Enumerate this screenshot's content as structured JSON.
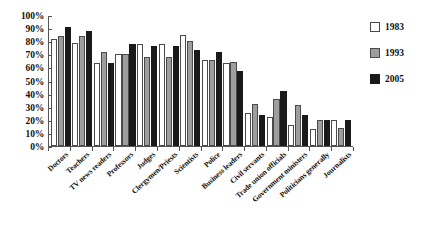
{
  "chart_data": {
    "type": "bar",
    "title": "",
    "xlabel": "",
    "ylabel": "",
    "ylim": [
      0,
      100
    ],
    "ytick_labels": [
      "100%",
      "90%",
      "80%",
      "70%",
      "60%",
      "50%",
      "40%",
      "30%",
      "20%",
      "10%",
      "0%"
    ],
    "ytick_values": [
      100,
      90,
      80,
      70,
      60,
      50,
      40,
      30,
      20,
      10,
      0
    ],
    "grid": false,
    "legend_position": "right",
    "categories": [
      "Doctors",
      "Teachers",
      "TV news readers",
      "Professors",
      "Judges",
      "Clergymen/Priests",
      "Scientists",
      "Police",
      "Business leaders",
      "Civil servants",
      "Trade union officials",
      "Government ministers",
      "Politicians generally",
      "Journalists"
    ],
    "series": [
      {
        "name": "1983",
        "color": "#ffffff",
        "values": [
          82,
          79,
          63,
          70,
          78,
          78,
          85,
          66,
          63,
          25,
          22,
          16,
          13,
          20
        ]
      },
      {
        "name": "1993",
        "color": "#9e9e9e",
        "values": [
          84,
          84,
          72,
          70,
          68,
          68,
          80,
          66,
          64,
          32,
          36,
          31,
          20,
          14
        ]
      },
      {
        "name": "2005",
        "color": "#1a1a1a",
        "values": [
          91,
          88,
          63,
          78,
          76,
          76,
          73,
          72,
          57,
          24,
          42,
          24,
          20,
          20
        ]
      }
    ]
  },
  "legend": {
    "items": [
      {
        "label": "1983",
        "key": "s1983"
      },
      {
        "label": "1993",
        "key": "s1993"
      },
      {
        "label": "2005",
        "key": "s2005"
      }
    ]
  }
}
